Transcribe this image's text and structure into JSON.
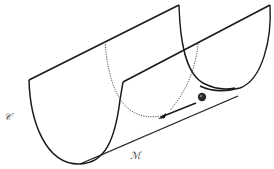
{
  "diagram": {
    "labels": {
      "surface": "𝒞",
      "manifold": "ℳ"
    },
    "elements": {
      "front_face": "solid U-shaped cross-section (front)",
      "back_face": "solid U-shaped cross-section (back)",
      "hidden_curves": "dotted hidden cross-sections",
      "valley_line": "dotted line along the bottom (manifold ℳ)",
      "ball": "dark sphere resting near the valley bottom",
      "arrow": "arrow indicating motion of ball along the valley"
    },
    "colors": {
      "stroke": "#1a1a1a",
      "dotted": "#555555",
      "ball": "#2a2a2a",
      "background": "#ffffff"
    }
  }
}
